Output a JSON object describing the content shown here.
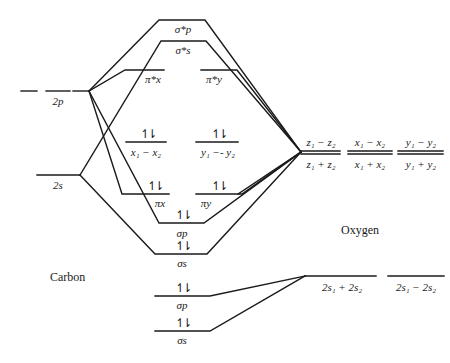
{
  "diagram": {
    "atoms": {
      "left": "Carbon",
      "right": "Oxygen"
    },
    "carbon_orbitals": {
      "p": "2p",
      "s": "2s"
    },
    "molecular_orbitals": {
      "sigma_p_star": "σ*p",
      "sigma_s_star": "σ*s",
      "pi_x_star": "π*x",
      "pi_y_star": "π*y",
      "nonbonding_x": "x₁ − x₂",
      "nonbonding_y": "y₁ −- y₂",
      "pi_x": "πx",
      "pi_y": "πy",
      "sigma_p": "σp",
      "sigma_s": "σs",
      "lower_sigma_p": "σp",
      "lower_sigma_s": "σs"
    },
    "oxygen_orbitals": {
      "z_minus": "z₁ − z₂",
      "z_plus": "z₁ + z₂",
      "x_minus": "x₁ − x₂",
      "x_plus": "x₁ + x₂",
      "y_minus": "y₁ − y₂",
      "y_plus": "y₁ + y₂",
      "s_plus": "2s₁ + 2s₂",
      "s_minus": "2s₁ − 2s₂"
    },
    "electron_pair": "↿⇂",
    "line_color": "#1a1a1a"
  }
}
